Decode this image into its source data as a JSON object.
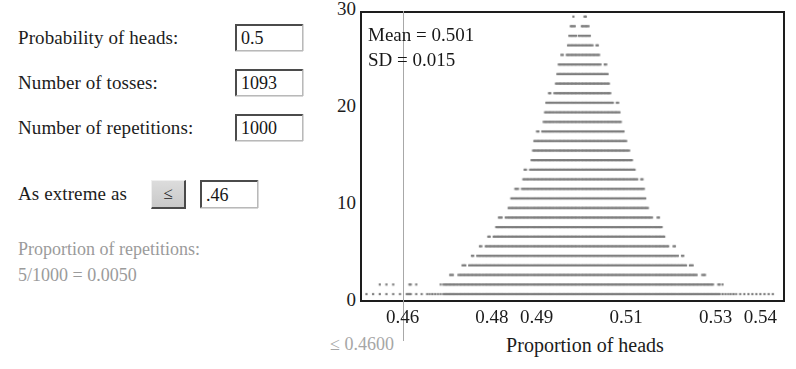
{
  "controls": {
    "probability": {
      "label": "Probability of heads:",
      "value": "0.5"
    },
    "tosses": {
      "label": "Number of tosses:",
      "value": "1093"
    },
    "repetitions": {
      "label": "Number of repetitions:",
      "value": "1000"
    },
    "extreme": {
      "label": "As extreme as",
      "operator": "≤",
      "value": ".46"
    },
    "result": {
      "line1": "Proportion of repetitions:",
      "line2": "5/1000 = 0.0050"
    }
  },
  "plot": {
    "annotation": {
      "mean_label": "Mean = 0.501",
      "sd_label": "SD = 0.015"
    },
    "xaxis_title": "Proportion of heads",
    "cut_readout": "≤ 0.4600",
    "colors": {
      "dot": "#7d7d7d",
      "frame": "#1d1d1d",
      "cutline": "#a8a8a8",
      "result_text": "#9b9b9b"
    }
  },
  "chart_data": {
    "type": "scatter",
    "title": "",
    "subtitle": "",
    "xlabel": "Proportion of heads",
    "ylabel": "",
    "xlim": [
      0.4505,
      0.5455
    ],
    "ylim": [
      0,
      30
    ],
    "grid": false,
    "legend": null,
    "notes": [
      "Dot plot (stacked dots): each dot is one repetition of 1093 coin tosses.",
      "Mean = 0.501, SD = 0.015, 1000 repetitions total.",
      "Vertical gray reference line drawn at 0.46 (the 'as extreme as' cutoff).",
      "5 of 1000 repetitions fall at or below 0.4600 (proportion 0.0050)."
    ],
    "xticks": [
      0.46,
      0.48,
      0.49,
      0.51,
      0.53,
      0.54
    ],
    "xticklabels": [
      "0.46",
      "0.48",
      "0.49",
      "0.51",
      "0.53",
      "0.54"
    ],
    "yticks": [
      0,
      10,
      20,
      30
    ],
    "yticklabels": [
      "0",
      "10",
      "20",
      "30"
    ],
    "cutoff": {
      "x": 0.46,
      "label": "≤ 0.4600",
      "count": 5,
      "total": 1000,
      "proportion": 0.005
    },
    "annotations": [
      {
        "text": "Mean = 0.501",
        "x": 0.4525,
        "y": 27.6
      },
      {
        "text": "SD = 0.015",
        "x": 0.4525,
        "y": 25.2
      }
    ],
    "distribution": {
      "mean": 0.501,
      "sd": 0.015,
      "n": 1000,
      "bin_width": 0.000915
    },
    "bins": [
      {
        "x": 0.4515,
        "count": 1
      },
      {
        "x": 0.456,
        "count": 2
      },
      {
        "x": 0.4606,
        "count": 1
      },
      {
        "x": 0.4615,
        "count": 2
      },
      {
        "x": 0.4652,
        "count": 1
      },
      {
        "x": 0.467,
        "count": 1
      },
      {
        "x": 0.4689,
        "count": 2
      },
      {
        "x": 0.4698,
        "count": 2
      },
      {
        "x": 0.4707,
        "count": 3
      },
      {
        "x": 0.4716,
        "count": 2
      },
      {
        "x": 0.4726,
        "count": 3
      },
      {
        "x": 0.4735,
        "count": 4
      },
      {
        "x": 0.4744,
        "count": 3
      },
      {
        "x": 0.4753,
        "count": 5
      },
      {
        "x": 0.4762,
        "count": 4
      },
      {
        "x": 0.4771,
        "count": 6
      },
      {
        "x": 0.4781,
        "count": 5
      },
      {
        "x": 0.479,
        "count": 7
      },
      {
        "x": 0.4799,
        "count": 6
      },
      {
        "x": 0.4808,
        "count": 8
      },
      {
        "x": 0.4817,
        "count": 9
      },
      {
        "x": 0.4826,
        "count": 8
      },
      {
        "x": 0.4836,
        "count": 10
      },
      {
        "x": 0.4845,
        "count": 11
      },
      {
        "x": 0.4854,
        "count": 12
      },
      {
        "x": 0.4863,
        "count": 11
      },
      {
        "x": 0.4872,
        "count": 14
      },
      {
        "x": 0.4881,
        "count": 13
      },
      {
        "x": 0.4891,
        "count": 16
      },
      {
        "x": 0.49,
        "count": 18
      },
      {
        "x": 0.4909,
        "count": 17
      },
      {
        "x": 0.4918,
        "count": 20
      },
      {
        "x": 0.4927,
        "count": 22
      },
      {
        "x": 0.4936,
        "count": 21
      },
      {
        "x": 0.4946,
        "count": 24
      },
      {
        "x": 0.4955,
        "count": 26
      },
      {
        "x": 0.4964,
        "count": 25
      },
      {
        "x": 0.4973,
        "count": 28
      },
      {
        "x": 0.4982,
        "count": 30
      },
      {
        "x": 0.4991,
        "count": 27
      },
      {
        "x": 0.5001,
        "count": 29
      },
      {
        "x": 0.501,
        "count": 30
      },
      {
        "x": 0.5019,
        "count": 28
      },
      {
        "x": 0.5028,
        "count": 26
      },
      {
        "x": 0.5037,
        "count": 27
      },
      {
        "x": 0.5046,
        "count": 24
      },
      {
        "x": 0.5056,
        "count": 25
      },
      {
        "x": 0.5065,
        "count": 22
      },
      {
        "x": 0.5074,
        "count": 20
      },
      {
        "x": 0.5083,
        "count": 21
      },
      {
        "x": 0.5092,
        "count": 18
      },
      {
        "x": 0.5101,
        "count": 17
      },
      {
        "x": 0.5111,
        "count": 15
      },
      {
        "x": 0.512,
        "count": 14
      },
      {
        "x": 0.5129,
        "count": 12
      },
      {
        "x": 0.5138,
        "count": 13
      },
      {
        "x": 0.5147,
        "count": 10
      },
      {
        "x": 0.5156,
        "count": 9
      },
      {
        "x": 0.5166,
        "count": 8
      },
      {
        "x": 0.5175,
        "count": 9
      },
      {
        "x": 0.5184,
        "count": 7
      },
      {
        "x": 0.5193,
        "count": 6
      },
      {
        "x": 0.5202,
        "count": 5
      },
      {
        "x": 0.5211,
        "count": 6
      },
      {
        "x": 0.5221,
        "count": 4
      },
      {
        "x": 0.523,
        "count": 5
      },
      {
        "x": 0.5239,
        "count": 3
      },
      {
        "x": 0.5248,
        "count": 4
      },
      {
        "x": 0.5257,
        "count": 3
      },
      {
        "x": 0.5266,
        "count": 2
      },
      {
        "x": 0.5276,
        "count": 3
      },
      {
        "x": 0.5285,
        "count": 2
      },
      {
        "x": 0.5294,
        "count": 2
      },
      {
        "x": 0.5303,
        "count": 1
      },
      {
        "x": 0.5312,
        "count": 2
      },
      {
        "x": 0.5331,
        "count": 1
      },
      {
        "x": 0.5349,
        "count": 1
      },
      {
        "x": 0.5377,
        "count": 1
      },
      {
        "x": 0.5404,
        "count": 1
      },
      {
        "x": 0.5432,
        "count": 1
      }
    ]
  }
}
